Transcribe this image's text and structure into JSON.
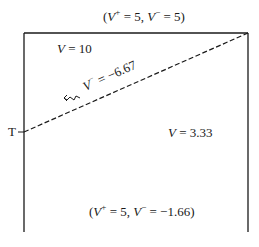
{
  "diagram": {
    "top_label": {
      "prefix": "(",
      "v1": "V",
      "s1": "+",
      "eq1": " = 5, ",
      "v2": "V",
      "s2": "−",
      "eq2": " = 5)"
    },
    "upper_region": {
      "var": "V",
      "eq": " = 10"
    },
    "boundary_label": {
      "var": "V",
      "sup": "−",
      "eq": " = −6.67"
    },
    "point_label": "T",
    "lower_region": {
      "var": "V",
      "eq": " = 3.33"
    },
    "bottom_label": {
      "prefix": "(",
      "v1": "V",
      "s1": "+",
      "eq1": " = 5, ",
      "v2": "V",
      "s2": "−",
      "eq2": " = −1.66)"
    },
    "arrow": "wavy-arrow-left",
    "colors": {
      "line": "#1a1a1a",
      "background": "#ffffff"
    }
  }
}
